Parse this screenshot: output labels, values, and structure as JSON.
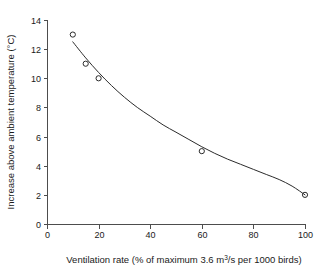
{
  "chart_data": {
    "type": "scatter",
    "title": "",
    "subtitle": "",
    "xlabel_parts": {
      "before": "Ventilation rate (% of maximum 3.6 m",
      "superscript": "3",
      "after": "/s per 1000 birds)"
    },
    "xlabel": "Ventilation rate (% of maximum 3.6 m3/s per 1000 birds)",
    "ylabel": "Increase above ambient temperature (°C)",
    "xlim": [
      0,
      100
    ],
    "ylim": [
      0,
      14
    ],
    "xticks": [
      0,
      20,
      40,
      60,
      80,
      100
    ],
    "yticks": [
      0,
      2,
      4,
      6,
      8,
      10,
      12,
      14
    ],
    "xtick_labels": [
      "0",
      "20",
      "40",
      "60",
      "80",
      "100"
    ],
    "ytick_labels": [
      "0",
      "2",
      "4",
      "6",
      "8",
      "10",
      "12",
      "14"
    ],
    "grid": false,
    "legend": false,
    "legend_position": "none",
    "marker_style": "open-circle",
    "marker_radius_px": 2.6,
    "series": [
      {
        "name": "Observed increase above ambient temperature",
        "x": [
          10,
          15,
          20,
          60,
          100
        ],
        "y": [
          13,
          11,
          10,
          5,
          2
        ]
      }
    ],
    "fit_curve": {
      "name": "fitted decay curve",
      "x": [
        10,
        15,
        20,
        25,
        30,
        35,
        40,
        45,
        50,
        55,
        60,
        65,
        70,
        75,
        80,
        85,
        90,
        95,
        100
      ],
      "y": [
        12.5,
        11.4,
        10.4,
        9.5,
        8.7,
        8.0,
        7.4,
        6.8,
        6.3,
        5.8,
        5.3,
        4.85,
        4.45,
        4.1,
        3.75,
        3.4,
        3.05,
        2.6,
        2.0
      ]
    },
    "colors": {
      "curve": "#2b2b2b",
      "marker": "#2b2b2b",
      "axis": "#4d4d4d",
      "text": "#1a1a1a",
      "background": "#ffffff"
    }
  },
  "geometry": {
    "plot_left_px": 47,
    "plot_right_px": 305,
    "plot_top_px": 20,
    "plot_bottom_px": 224
  }
}
